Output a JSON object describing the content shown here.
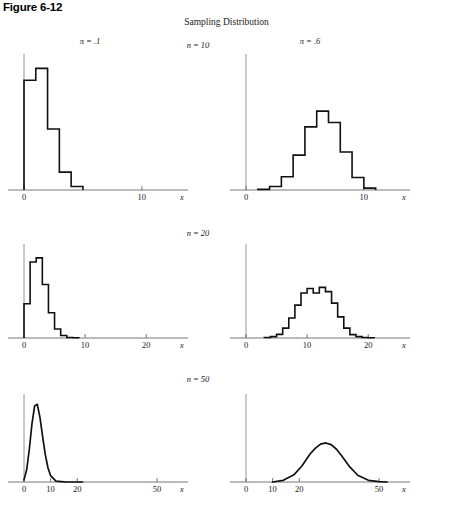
{
  "figure": {
    "header": "Figure 6-12",
    "title": "Sampling Distribution",
    "x_axis_label": "x"
  },
  "columns": [
    {
      "label": "π = .1"
    },
    {
      "label": "π = .6"
    }
  ],
  "rows": [
    {
      "label": "n = 10"
    },
    {
      "label": "n = 20"
    },
    {
      "label": "n = 50"
    }
  ],
  "chart_data": [
    {
      "type": "bar",
      "title": "n = 10, π = .1",
      "xlabel": "x",
      "ylabel": "",
      "xlim": [
        0,
        14
      ],
      "ylim": [
        0,
        0.42
      ],
      "ticks": [
        0,
        10
      ],
      "categories": [
        0,
        1,
        2,
        3,
        4
      ],
      "values": [
        0.349,
        0.387,
        0.194,
        0.057,
        0.011
      ],
      "grid": false
    },
    {
      "type": "bar",
      "title": "n = 10, π = .6",
      "xlabel": "x",
      "ylabel": "",
      "xlim": [
        0,
        14
      ],
      "ylim": [
        0,
        0.42
      ],
      "ticks": [
        0,
        10
      ],
      "categories": [
        1,
        2,
        3,
        4,
        5,
        6,
        7,
        8,
        9,
        10
      ],
      "values": [
        0.002,
        0.011,
        0.042,
        0.111,
        0.201,
        0.251,
        0.215,
        0.121,
        0.04,
        0.006
      ],
      "grid": false
    },
    {
      "type": "bar",
      "title": "n = 20, π = .1",
      "xlabel": "x",
      "ylabel": "",
      "xlim": [
        0,
        27
      ],
      "ylim": [
        0,
        0.32
      ],
      "ticks": [
        0,
        10,
        20
      ],
      "categories": [
        0,
        1,
        2,
        3,
        4,
        5,
        6,
        7,
        8
      ],
      "values": [
        0.122,
        0.27,
        0.285,
        0.19,
        0.09,
        0.032,
        0.009,
        0.002,
        0.001
      ],
      "grid": false
    },
    {
      "type": "bar",
      "title": "n = 20, π = .6",
      "xlabel": "x",
      "ylabel": "",
      "xlim": [
        0,
        27
      ],
      "ylim": [
        0,
        0.32
      ],
      "ticks": [
        0,
        10,
        20
      ],
      "categories": [
        3,
        4,
        5,
        6,
        7,
        8,
        9,
        10,
        11,
        12,
        13,
        14,
        15,
        16,
        17,
        18,
        19,
        20
      ],
      "values": [
        0.002,
        0.005,
        0.013,
        0.035,
        0.071,
        0.117,
        0.16,
        0.176,
        0.16,
        0.18,
        0.165,
        0.124,
        0.075,
        0.035,
        0.012,
        0.005,
        0.002,
        0.001
      ],
      "grid": false
    },
    {
      "type": "line",
      "title": "n = 50, π = .1",
      "xlabel": "x",
      "ylabel": "",
      "xlim": [
        0,
        62
      ],
      "ylim": [
        0,
        0.2
      ],
      "ticks": [
        0,
        10,
        20,
        50
      ],
      "peak_x": 5,
      "spread": 2.1,
      "x": [
        0,
        1,
        2,
        3,
        4,
        5,
        6,
        7,
        8,
        9,
        10,
        12,
        14,
        16,
        18,
        20,
        22
      ],
      "y": [
        0.005,
        0.029,
        0.078,
        0.139,
        0.181,
        0.185,
        0.154,
        0.108,
        0.065,
        0.034,
        0.015,
        0.002,
        0.001,
        0.0,
        0.0,
        0.0,
        0.0
      ],
      "grid": false
    },
    {
      "type": "line",
      "title": "n = 50, π = .6",
      "xlabel": "x",
      "ylabel": "",
      "xlim": [
        0,
        62
      ],
      "ylim": [
        0,
        0.2
      ],
      "ticks": [
        0,
        10,
        20,
        50
      ],
      "peak_x": 30,
      "spread": 6.9,
      "x": [
        10,
        14,
        18,
        21,
        24,
        26,
        28,
        30,
        32,
        34,
        36,
        39,
        42,
        46,
        50,
        53
      ],
      "y": [
        0.0,
        0.004,
        0.017,
        0.038,
        0.066,
        0.08,
        0.09,
        0.093,
        0.089,
        0.078,
        0.062,
        0.036,
        0.016,
        0.004,
        0.001,
        0.0
      ],
      "grid": false
    }
  ]
}
